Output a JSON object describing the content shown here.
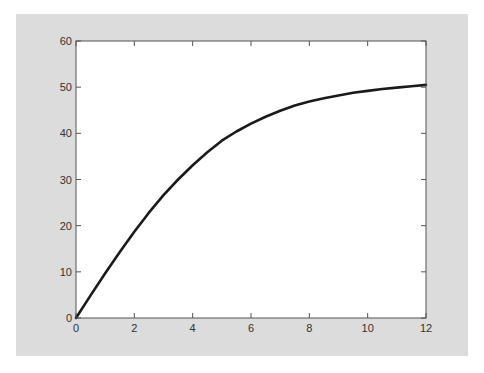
{
  "chart_data": {
    "type": "line",
    "title": "",
    "xlabel": "",
    "ylabel": "",
    "xlim": [
      0,
      12
    ],
    "ylim": [
      0,
      60
    ],
    "grid": false,
    "legend": null,
    "x_ticks": [
      0,
      2,
      4,
      6,
      8,
      10,
      12
    ],
    "y_ticks": [
      0,
      10,
      20,
      30,
      40,
      50,
      60
    ],
    "x_tick_labels": [
      "0",
      "2",
      "4",
      "6",
      "8",
      "10",
      "12"
    ],
    "y_tick_labels": [
      "0",
      "10",
      "20",
      "30",
      "40",
      "50",
      "60"
    ],
    "series": [
      {
        "name": "curve",
        "color": "#1a1a1a",
        "x": [
          0,
          0.5,
          1,
          1.5,
          2,
          2.5,
          3,
          3.5,
          4,
          4.5,
          5,
          5.5,
          6,
          6.5,
          7,
          7.5,
          8,
          8.5,
          9,
          9.5,
          10,
          10.5,
          11,
          11.5,
          12
        ],
        "values": [
          0,
          4.9,
          9.7,
          14.3,
          18.7,
          22.8,
          26.6,
          30.0,
          33.1,
          35.9,
          38.4,
          40.4,
          42.1,
          43.6,
          44.9,
          46.0,
          46.9,
          47.6,
          48.2,
          48.8,
          49.2,
          49.6,
          49.9,
          50.2,
          50.5
        ]
      }
    ]
  },
  "colors": {
    "figure_background": "#dcdcdc",
    "plot_background": "#ffffff",
    "axis": "#555555",
    "line": "#1a1a1a",
    "text": "#333333"
  }
}
